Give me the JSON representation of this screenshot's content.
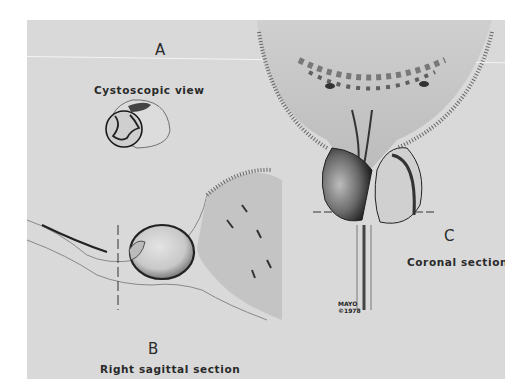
{
  "figure": {
    "background_color": "#d9d9d9",
    "panels": [
      {
        "letter": "A",
        "caption": "Cystoscopic view"
      },
      {
        "letter": "B",
        "caption": "Right sagittal section"
      },
      {
        "letter": "C",
        "caption": "Coronal section"
      }
    ],
    "credit": {
      "line1": "MAYO",
      "line2": "©1978"
    }
  }
}
